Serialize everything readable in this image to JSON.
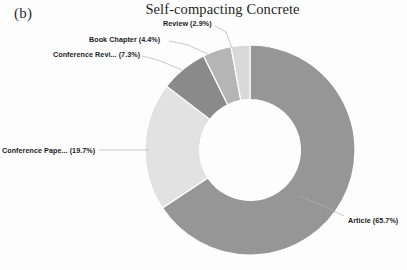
{
  "panel": {
    "label": "(b)"
  },
  "chart_data": {
    "type": "pie",
    "variant": "donut",
    "title": "Self-compacting Concrete",
    "xlabel": "",
    "ylabel": "",
    "grid": false,
    "legend": "none",
    "label_format": "{name} ({percent}%)",
    "start_angle_deg": 0,
    "direction": "clockwise",
    "inner_radius_ratio": 0.48,
    "categories": [
      "Article",
      "Conference Pape...",
      "Conference Revi...",
      "Book Chapter",
      "Review"
    ],
    "values": [
      65.7,
      19.7,
      7.3,
      4.4,
      2.9
    ],
    "colors": [
      "#969696",
      "#e2e2e2",
      "#8a8a8a",
      "#b5b5b5",
      "#d9d9d9"
    ],
    "slices": [
      {
        "name": "Article",
        "percent": 65.7,
        "label": "Article (65.7%)",
        "color": "#969696"
      },
      {
        "name": "Conference Pape...",
        "percent": 19.7,
        "label": "Conference Pape... (19.7%)",
        "color": "#e2e2e2"
      },
      {
        "name": "Conference Revi...",
        "percent": 7.3,
        "label": "Conference Revi... (7.3%)",
        "color": "#8a8a8a"
      },
      {
        "name": "Book Chapter",
        "percent": 4.4,
        "label": "Book Chapter (4.4%)",
        "color": "#b5b5b5"
      },
      {
        "name": "Review",
        "percent": 2.9,
        "label": "Review (2.9%)",
        "color": "#d9d9d9"
      }
    ]
  }
}
